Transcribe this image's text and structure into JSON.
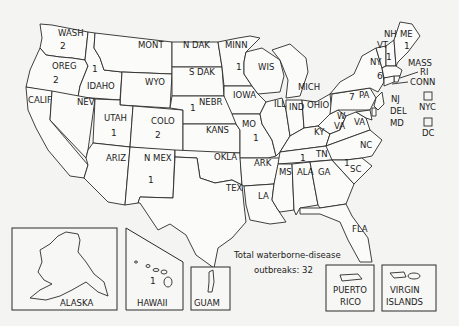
{
  "map": {
    "note_line1": "Total waterborne-disease",
    "note_line2": "outbreaks: 32",
    "states": [
      {
        "abbr": "WASH",
        "count": "2"
      },
      {
        "abbr": "OREG",
        "count": "2"
      },
      {
        "abbr": "IDAHO",
        "count": "1"
      },
      {
        "abbr": "MONT",
        "count": ""
      },
      {
        "abbr": "N DAK",
        "count": ""
      },
      {
        "abbr": "MINN",
        "count": "1"
      },
      {
        "abbr": "WYO",
        "count": ""
      },
      {
        "abbr": "S DAK",
        "count": ""
      },
      {
        "abbr": "WIS",
        "count": ""
      },
      {
        "abbr": "MICH",
        "count": ""
      },
      {
        "abbr": "CALIF",
        "count": ""
      },
      {
        "abbr": "NEV",
        "count": ""
      },
      {
        "abbr": "UTAH",
        "count": "1"
      },
      {
        "abbr": "COLO",
        "count": "2"
      },
      {
        "abbr": "NEBR",
        "count": "1"
      },
      {
        "abbr": "IOWA",
        "count": ""
      },
      {
        "abbr": "KANS",
        "count": ""
      },
      {
        "abbr": "MO",
        "count": "1"
      },
      {
        "abbr": "ILL",
        "count": ""
      },
      {
        "abbr": "IND",
        "count": ""
      },
      {
        "abbr": "OHIO",
        "count": ""
      },
      {
        "abbr": "KY",
        "count": ""
      },
      {
        "abbr": "W VA",
        "count": ""
      },
      {
        "abbr": "VA",
        "count": ""
      },
      {
        "abbr": "ARIZ",
        "count": ""
      },
      {
        "abbr": "N MEX",
        "count": "1"
      },
      {
        "abbr": "OKLA",
        "count": ""
      },
      {
        "abbr": "TEX",
        "count": ""
      },
      {
        "abbr": "ARK",
        "count": ""
      },
      {
        "abbr": "LA",
        "count": ""
      },
      {
        "abbr": "MS",
        "count": ""
      },
      {
        "abbr": "ALA",
        "count": ""
      },
      {
        "abbr": "GA",
        "count": ""
      },
      {
        "abbr": "TN",
        "count": "1"
      },
      {
        "abbr": "NC",
        "count": ""
      },
      {
        "abbr": "SC",
        "count": "1"
      },
      {
        "abbr": "FLA",
        "count": ""
      },
      {
        "abbr": "PA",
        "count": "7"
      },
      {
        "abbr": "NY",
        "count": "6"
      },
      {
        "abbr": "VT",
        "count": "1"
      },
      {
        "abbr": "NH",
        "count": ""
      },
      {
        "abbr": "ME",
        "count": "1"
      },
      {
        "abbr": "MASS",
        "count": ""
      },
      {
        "abbr": "RI",
        "count": ""
      },
      {
        "abbr": "CONN",
        "count": ""
      },
      {
        "abbr": "NJ",
        "count": ""
      },
      {
        "abbr": "DEL",
        "count": ""
      },
      {
        "abbr": "MD",
        "count": ""
      },
      {
        "abbr": "NYC",
        "count": ""
      },
      {
        "abbr": "DC",
        "count": ""
      }
    ],
    "insets": [
      {
        "name": "ALASKA",
        "count": ""
      },
      {
        "name": "HAWAII",
        "count": "1"
      },
      {
        "name": "GUAM",
        "count": ""
      },
      {
        "name_line1": "PUERTO",
        "name_line2": "RICO",
        "count": ""
      },
      {
        "name_line1": "VIRGIN",
        "name_line2": "ISLANDS",
        "count": ""
      }
    ]
  }
}
